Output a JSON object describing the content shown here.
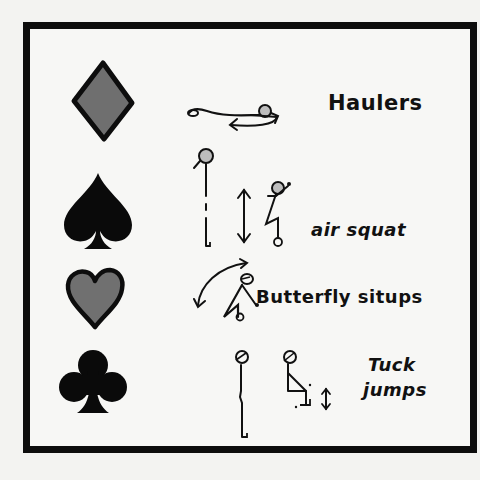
{
  "card": {
    "border_color": "#0d0d0d",
    "background": "#f7f7f5"
  },
  "rows": [
    {
      "suit": "diamond",
      "suit_icon": "diamond-icon",
      "suit_fill": "#6f6f6f",
      "exercise": "Haulers",
      "figure": "lying-figure-with-circular-arrow"
    },
    {
      "suit": "spade",
      "suit_icon": "spade-icon",
      "suit_fill": "#0a0a0a",
      "exercise": "air squat",
      "figure": "standing-to-squat-with-up-down-arrow"
    },
    {
      "suit": "heart",
      "suit_icon": "heart-icon",
      "suit_fill": "#707070",
      "exercise": "Butterfly situps",
      "figure": "situp-figure-with-arc-arrow"
    },
    {
      "suit": "club",
      "suit_icon": "club-icon",
      "suit_fill": "#0a0a0a",
      "exercise_line1": "Tuck",
      "exercise_line2": "jumps",
      "figure": "standing-to-tuck-with-up-down-arrow"
    }
  ]
}
